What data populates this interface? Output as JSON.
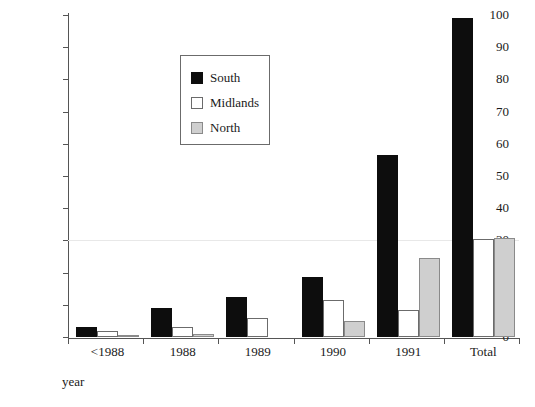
{
  "chart_data": {
    "type": "bar",
    "title": "",
    "xlabel": "year",
    "ylabel": "number of assessments",
    "categories": [
      "<1988",
      "1988",
      "1989",
      "1990",
      "1991",
      "Total"
    ],
    "series": [
      {
        "name": "South",
        "color": "#0d0d0d",
        "values": [
          3,
          9,
          12.5,
          18.5,
          56.5,
          99
        ]
      },
      {
        "name": "Midlands",
        "color": "#ffffff",
        "values": [
          2,
          3,
          6,
          11.5,
          8.5,
          30.5
        ]
      },
      {
        "name": "North",
        "color": "#cfcfcf",
        "values": [
          0.5,
          1,
          0,
          5,
          24.5,
          30.8
        ]
      }
    ],
    "ylim": [
      0,
      100
    ],
    "yticks": [
      0,
      10,
      20,
      30,
      40,
      50,
      60,
      70,
      80,
      90,
      100
    ],
    "ytick_labels": [
      "0",
      "10",
      "20",
      "30",
      "40",
      "50",
      "60",
      "70",
      "80",
      "90",
      "100"
    ],
    "grid": "faint horizontal line at 30",
    "legend_position": "upper-left-inside"
  }
}
